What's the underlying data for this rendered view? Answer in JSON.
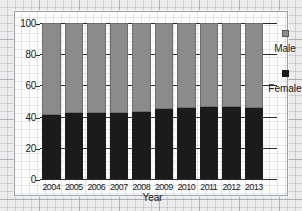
{
  "chart_data": {
    "type": "bar",
    "stacked": true,
    "title": "",
    "xlabel": "Year",
    "ylabel": "",
    "ylim": [
      0,
      100
    ],
    "yticks": [
      0,
      20,
      40,
      60,
      80,
      100
    ],
    "grid": true,
    "legend_position": "right",
    "categories": [
      "2004",
      "2005",
      "2006",
      "2007",
      "2008",
      "2009",
      "2010",
      "2011",
      "2012",
      "2013"
    ],
    "series": [
      {
        "name": "Female",
        "color": "#1b1b1b",
        "values": [
          41,
          42,
          42,
          42,
          43,
          45,
          45.5,
          46,
          46,
          45.5
        ]
      },
      {
        "name": "Male",
        "color": "#8b8b8b",
        "values": [
          59,
          58,
          58,
          58,
          57,
          55,
          54.5,
          54,
          54,
          54.5
        ]
      }
    ]
  },
  "legend": {
    "items": [
      {
        "label": "Male",
        "swatch": "male-swatch"
      },
      {
        "label": "Female",
        "swatch": "female-swatch"
      }
    ]
  },
  "axes": {
    "x_title": "Year",
    "y_tick_labels": [
      "100",
      "80",
      "60",
      "40",
      "20",
      "0"
    ]
  }
}
